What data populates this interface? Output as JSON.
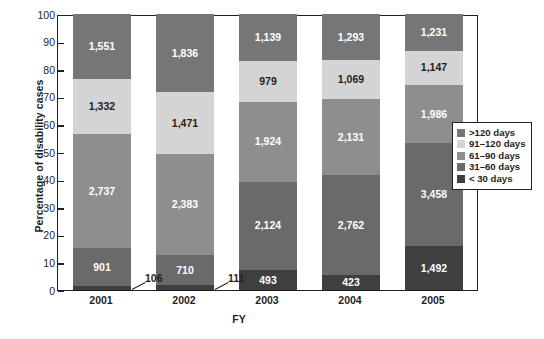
{
  "chart_data": {
    "type": "bar",
    "subtype": "stacked-bar-percent",
    "title": "",
    "xlabel": "FY",
    "ylabel": "Percentage of disability cases",
    "categories": [
      "2001",
      "2002",
      "2003",
      "2004",
      "2005"
    ],
    "ylim": [
      0,
      100
    ],
    "yticks": [
      0,
      10,
      20,
      30,
      40,
      50,
      60,
      70,
      80,
      90,
      100
    ],
    "grid": false,
    "legend_position": "right-middle",
    "stack_order_bottom_to_top": [
      "< 30 days",
      "31-60 days",
      "61-90 days",
      "91-120 days",
      ">120 days"
    ],
    "series": [
      {
        "name": "< 30 days",
        "color": "#3f3f3f",
        "values": [
          106,
          111,
          493,
          423,
          1492
        ],
        "labels": [
          "106",
          "111",
          "493",
          "423",
          "1,492"
        ],
        "percents": [
          1.6,
          1.7,
          7.4,
          5.5,
          16.0
        ]
      },
      {
        "name": "31-60 days",
        "color": "#6a6a6a",
        "values": [
          901,
          710,
          2124,
          2762,
          3458
        ],
        "labels": [
          "901",
          "710",
          "2,124",
          "2,762",
          "3,458"
        ],
        "percents": [
          13.6,
          10.9,
          31.9,
          36.0,
          37.1
        ]
      },
      {
        "name": "61-90 days",
        "color": "#8e8e8e",
        "values": [
          2737,
          2383,
          1924,
          2131,
          1986
        ],
        "labels": [
          "2,737",
          "2,383",
          "1,924",
          "2,131",
          "1,986"
        ],
        "percents": [
          41.3,
          36.6,
          28.9,
          27.8,
          21.3
        ]
      },
      {
        "name": "91-120 days",
        "color": "#d4d4d4",
        "values": [
          1332,
          1471,
          979,
          1069,
          1147
        ],
        "labels": [
          "1,332",
          "1,471",
          "979",
          "1,069",
          "1,147"
        ],
        "percents": [
          20.1,
          22.6,
          14.7,
          13.9,
          12.3
        ]
      },
      {
        "name": ">120 days",
        "color": "#767676",
        "values": [
          1551,
          1836,
          1139,
          1293,
          1231
        ],
        "labels": [
          "1,551",
          "1,836",
          "1,139",
          "1,293",
          "1,231"
        ],
        "percents": [
          23.4,
          28.2,
          17.1,
          16.8,
          13.2
        ]
      }
    ],
    "totals": [
      6627,
      6511,
      6659,
      7678,
      9314
    ],
    "callout_labels": [
      {
        "category": "2001",
        "series": "< 30 days",
        "label": "106"
      },
      {
        "category": "2002",
        "series": "< 30 days",
        "label": "111"
      }
    ]
  },
  "axis": {
    "y_title": "Percentage of disability cases",
    "x_title": "FY",
    "y_tick_labels": [
      "100",
      "90",
      "80",
      "70",
      "60",
      "50",
      "40",
      "30",
      "20",
      "10",
      "0"
    ],
    "x_tick_labels": [
      "2001",
      "2002",
      "2003",
      "2004",
      "2005"
    ]
  },
  "legend": {
    "items": [
      {
        "label": ">120 days",
        "color": "#767676"
      },
      {
        "label": "91–120 days",
        "color": "#d4d4d4"
      },
      {
        "label": "61–90 days",
        "color": "#8e8e8e"
      },
      {
        "label": "31–60 days",
        "color": "#6a6a6a"
      },
      {
        "label": "< 30 days",
        "color": "#3f3f3f"
      }
    ]
  },
  "colors": {
    "axis": "#231f20",
    "background": "#ffffff",
    "label_on_dark": "#ffffff",
    "label_on_light": "#231f20"
  }
}
